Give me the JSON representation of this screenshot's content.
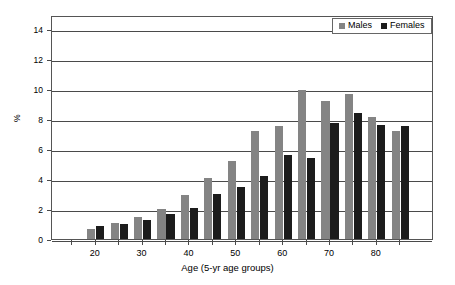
{
  "chart_data": {
    "type": "bar",
    "title": "",
    "subtitle": "",
    "xlabel": "Age (5-yr age groups)",
    "ylabel": "%",
    "ylim": [
      0,
      15
    ],
    "yticks": [
      0,
      2,
      4,
      6,
      8,
      10,
      12,
      14
    ],
    "ytick_labels": [
      "0",
      "2",
      "4",
      "6",
      "8",
      "10",
      "12",
      "14"
    ],
    "xticks": [
      20,
      30,
      40,
      50,
      60,
      70,
      80
    ],
    "xtick_labels": [
      "20",
      "30",
      "40",
      "50",
      "60",
      "70",
      "80"
    ],
    "grid": "horizontal",
    "legend_position": "top-right",
    "categories": [
      20,
      25,
      30,
      35,
      40,
      45,
      50,
      55,
      60,
      65,
      70,
      75,
      80,
      85
    ],
    "series": [
      {
        "name": "Males",
        "color": "#848484",
        "values": [
          0.7,
          1.1,
          1.5,
          2.0,
          2.95,
          4.1,
          5.25,
          7.2,
          7.6,
          10.0,
          9.25,
          9.7,
          8.15,
          7.2
        ]
      },
      {
        "name": "Females",
        "color": "#1c1c1c",
        "values": [
          0.9,
          1.0,
          1.3,
          1.65,
          2.1,
          3.0,
          3.45,
          4.25,
          5.6,
          5.45,
          7.8,
          8.45,
          7.65,
          7.6
        ]
      }
    ]
  },
  "legend": {
    "entries": [
      {
        "label": "Males"
      },
      {
        "label": "Females"
      }
    ]
  },
  "axes": {
    "y_title": "%",
    "x_title": "Age (5-yr age groups)"
  }
}
